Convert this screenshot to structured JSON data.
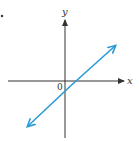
{
  "diagram": {
    "type": "coordinate-plane-line",
    "x_axis_label": "x",
    "y_axis_label": "y",
    "origin_label": "0",
    "line": {
      "description": "straight line with positive slope, negative y-intercept, positive x-intercept, arrows at both ends",
      "color": "#2a9ad6"
    },
    "axis_color": "#333333"
  }
}
